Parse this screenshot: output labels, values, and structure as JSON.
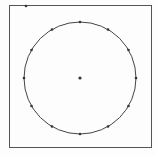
{
  "diagram": {
    "type": "circle-with-points",
    "frame": {
      "x": 9.5,
      "y": 5.5,
      "width": 142,
      "height": 142,
      "stroke": "#555555"
    },
    "circle": {
      "cx": 80,
      "cy": 78,
      "r": 56,
      "stroke": "#444444"
    },
    "center_point": {
      "x": 80,
      "y": 78
    },
    "corner_marker": {
      "x": 26,
      "y": 6
    },
    "circumference_points_count": 12,
    "point_color": "#333333"
  }
}
